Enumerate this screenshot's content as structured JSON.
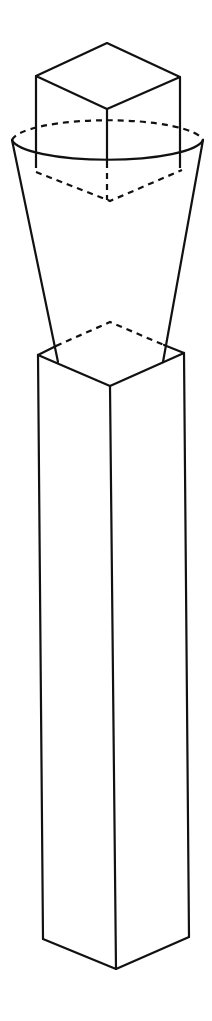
{
  "diagram": {
    "title": "",
    "stroke_color": "#111111",
    "background": "#ffffff",
    "shapes": [
      {
        "name": "cube",
        "type": "isometric-cube"
      },
      {
        "name": "funnel",
        "type": "truncated-cone",
        "rim": "ellipse"
      },
      {
        "name": "column",
        "type": "square-prism"
      }
    ]
  }
}
